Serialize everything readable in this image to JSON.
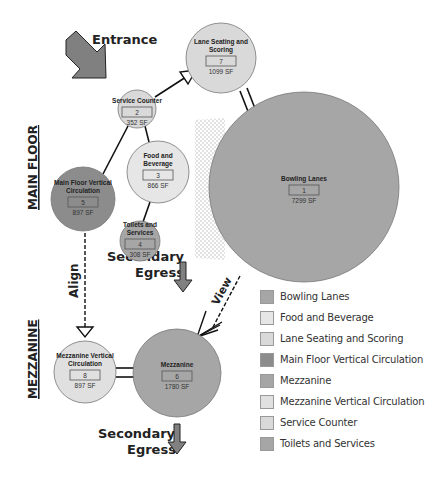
{
  "labels": {
    "entrance": "Entrance",
    "main_floor": "MAIN FLOOR",
    "mezzanine": "MEZZANINE",
    "align": "Align",
    "view": "View",
    "secondary_egress_1_line1": "Secondary",
    "secondary_egress_1_line2": "Egress",
    "secondary_egress_2_line1": "Secondary",
    "secondary_egress_2_line2": "Egress"
  },
  "nodes": [
    {
      "id": "1",
      "title_lines": [
        "Bowling Lanes"
      ],
      "sf": "7299 SF",
      "color": "#a6a6a6",
      "cx": 304,
      "cy": 187,
      "r": 95
    },
    {
      "id": "2",
      "title_lines": [
        "Service Counter"
      ],
      "sf": "352 SF",
      "color": "#d9d9d9",
      "cx": 137,
      "cy": 109,
      "r": 19
    },
    {
      "id": "3",
      "title_lines": [
        "Food and",
        "Beverage"
      ],
      "sf": "866 SF",
      "color": "#e6e6e6",
      "cx": 158,
      "cy": 172,
      "r": 31
    },
    {
      "id": "4",
      "title_lines": [
        "Toilets and",
        "Services"
      ],
      "sf": "308 SF",
      "color": "#a6a6a6",
      "cx": 140,
      "cy": 241,
      "r": 20
    },
    {
      "id": "5",
      "title_lines": [
        "Main Floor Vertical",
        "Circulation"
      ],
      "sf": "897 SF",
      "color": "#8c8c8c",
      "cx": 83,
      "cy": 199,
      "r": 32
    },
    {
      "id": "6",
      "title_lines": [
        "Mezzanine"
      ],
      "sf": "1780 SF",
      "color": "#a6a6a6",
      "cx": 177,
      "cy": 373,
      "r": 44
    },
    {
      "id": "7",
      "title_lines": [
        "Lane Seating and",
        "Scoring"
      ],
      "sf": "1099 SF",
      "color": "#d9d9d9",
      "cx": 221,
      "cy": 58,
      "r": 35
    },
    {
      "id": "8",
      "title_lines": [
        "Mezzanine Vertical",
        "Circulation"
      ],
      "sf": "897 SF",
      "color": "#e0e0e0",
      "cx": 85,
      "cy": 372,
      "r": 31
    }
  ],
  "legend": [
    {
      "label": "Bowling Lanes",
      "color": "#a6a6a6"
    },
    {
      "label": "Food and Beverage",
      "color": "#e6e6e6"
    },
    {
      "label": "Lane Seating and Scoring",
      "color": "#d9d9d9"
    },
    {
      "label": "Main Floor Vertical Circulation",
      "color": "#8c8c8c"
    },
    {
      "label": "Mezzanine",
      "color": "#a6a6a6"
    },
    {
      "label": "Mezzanine Vertical Circulation",
      "color": "#e0e0e0"
    },
    {
      "label": "Service Counter",
      "color": "#d9d9d9"
    },
    {
      "label": "Toilets and Services",
      "color": "#a6a6a6"
    }
  ],
  "colors": {
    "arrow_fill": "#808080",
    "line": "#111111",
    "hatch": "#dddddd"
  }
}
